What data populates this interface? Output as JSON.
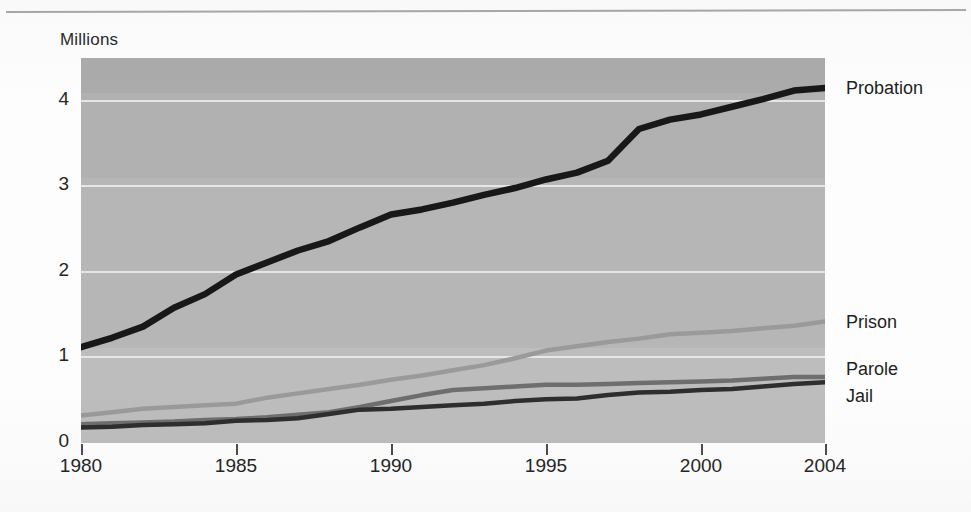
{
  "figure": {
    "y_axis_unit_label": "Millions",
    "y_ticks": [
      "0",
      "1",
      "2",
      "3",
      "4"
    ],
    "x_ticks": [
      "1980",
      "1985",
      "1990",
      "1995",
      "2000",
      "2004"
    ],
    "series_labels": {
      "probation": "Probation",
      "prison": "Prison",
      "parole": "Parole",
      "jail": "Jail"
    },
    "colors": {
      "plot_background": "#b6b6b6",
      "gridline": "#eceaea",
      "probation": "#181818",
      "prison": "#9a9a9a",
      "parole": "#6e6e6e",
      "jail": "#2e2e2e",
      "page_background": "#fdfdfd",
      "top_rule": "#a9a9a9",
      "text": "#262626"
    }
  },
  "chart_data": {
    "type": "line",
    "title": "",
    "subtitle": "",
    "xlabel": "",
    "ylabel": "Millions",
    "xlim": [
      1980,
      2004
    ],
    "ylim": [
      0,
      4.5
    ],
    "grid": true,
    "legend_position": "right-inline",
    "x": [
      1980,
      1981,
      1982,
      1983,
      1984,
      1985,
      1986,
      1987,
      1988,
      1989,
      1990,
      1991,
      1992,
      1993,
      1994,
      1995,
      1996,
      1997,
      1998,
      1999,
      2000,
      2001,
      2002,
      2003,
      2004
    ],
    "tick_values_x": [
      1980,
      1985,
      1990,
      1995,
      2000,
      2004
    ],
    "tick_values_y": [
      0,
      1,
      2,
      3,
      4
    ],
    "series": [
      {
        "name": "Probation",
        "color": "#181818",
        "values": [
          1.12,
          1.23,
          1.36,
          1.58,
          1.74,
          1.97,
          2.11,
          2.25,
          2.36,
          2.52,
          2.67,
          2.73,
          2.81,
          2.9,
          2.98,
          3.08,
          3.16,
          3.3,
          3.67,
          3.78,
          3.84,
          3.93,
          4.02,
          4.12,
          4.15
        ]
      },
      {
        "name": "Prison",
        "color": "#9a9a9a",
        "values": [
          0.32,
          0.36,
          0.4,
          0.42,
          0.44,
          0.46,
          0.53,
          0.58,
          0.63,
          0.68,
          0.74,
          0.79,
          0.85,
          0.91,
          0.99,
          1.08,
          1.13,
          1.18,
          1.22,
          1.27,
          1.29,
          1.31,
          1.34,
          1.37,
          1.42
        ]
      },
      {
        "name": "Parole",
        "color": "#6e6e6e",
        "values": [
          0.22,
          0.23,
          0.24,
          0.25,
          0.27,
          0.28,
          0.3,
          0.33,
          0.36,
          0.42,
          0.49,
          0.56,
          0.62,
          0.64,
          0.66,
          0.68,
          0.68,
          0.69,
          0.7,
          0.71,
          0.72,
          0.73,
          0.75,
          0.77,
          0.77
        ]
      },
      {
        "name": "Jail",
        "color": "#2e2e2e",
        "values": [
          0.18,
          0.19,
          0.21,
          0.22,
          0.23,
          0.26,
          0.27,
          0.29,
          0.34,
          0.39,
          0.4,
          0.42,
          0.44,
          0.46,
          0.49,
          0.51,
          0.52,
          0.56,
          0.59,
          0.6,
          0.62,
          0.63,
          0.66,
          0.69,
          0.71
        ]
      }
    ]
  }
}
